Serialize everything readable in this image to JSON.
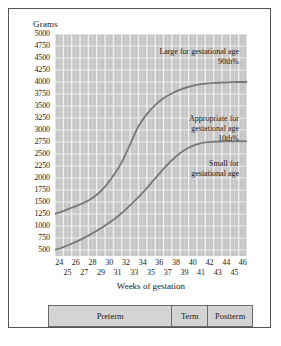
{
  "chart_data": {
    "type": "line",
    "title": "",
    "xlabel": "Weeks of gestation",
    "ylabel": "Grams",
    "xlim": [
      24,
      47
    ],
    "ylim": [
      375,
      5000
    ],
    "grid": true,
    "legend": "none",
    "x_ticks_even": [
      24,
      26,
      28,
      30,
      32,
      34,
      36,
      38,
      40,
      42,
      44,
      46
    ],
    "x_ticks_odd": [
      25,
      27,
      29,
      31,
      33,
      35,
      37,
      39,
      41,
      43,
      45
    ],
    "y_ticks": [
      5000,
      4750,
      4500,
      4250,
      4000,
      3750,
      3500,
      3250,
      3000,
      2750,
      2500,
      2250,
      2000,
      1750,
      1500,
      1250,
      1000,
      750,
      500
    ],
    "x": [
      24,
      25,
      26,
      27,
      28,
      29,
      30,
      31,
      32,
      33,
      34,
      35,
      36,
      37,
      38,
      39,
      40,
      41,
      42,
      43,
      44,
      45,
      46,
      47
    ],
    "series": [
      {
        "name": "90th percentile",
        "label": "90th%",
        "color": "#787878",
        "values": [
          1250,
          1310,
          1380,
          1450,
          1530,
          1650,
          1820,
          2050,
          2330,
          2700,
          3080,
          3330,
          3520,
          3660,
          3760,
          3840,
          3900,
          3940,
          3965,
          3980,
          3990,
          3995,
          4000,
          4000
        ]
      },
      {
        "name": "10th percentile",
        "label": "10th%",
        "color": "#787878",
        "values": [
          500,
          560,
          630,
          710,
          800,
          900,
          1010,
          1130,
          1270,
          1430,
          1600,
          1790,
          1990,
          2190,
          2370,
          2520,
          2630,
          2700,
          2740,
          2755,
          2760,
          2762,
          2765,
          2765
        ]
      }
    ],
    "annotations": [
      {
        "id": "lga",
        "line1": "Large for gestational age",
        "line2": "90th%"
      },
      {
        "id": "aga",
        "line1": "Appropriate for",
        "line2": "gestational age",
        "line3": "10th%"
      },
      {
        "id": "sga",
        "line1": "Small for",
        "line2": "gestational age"
      }
    ],
    "periods": [
      {
        "label": "Preterm",
        "start": 24,
        "end": 38,
        "flex": 14
      },
      {
        "label": "Term",
        "start": 38,
        "end": 42,
        "flex": 4
      },
      {
        "label": "Postterm",
        "start": 42,
        "end": 47,
        "flex": 5
      }
    ],
    "colors": {
      "plot_background": "#c6c6c6",
      "gridline": "#f0f0f0",
      "curve": "#787878",
      "frame_border": "#555555",
      "period_bar_fill": "#d4d4d4",
      "period_bar_border": "#6a6a6a"
    }
  }
}
